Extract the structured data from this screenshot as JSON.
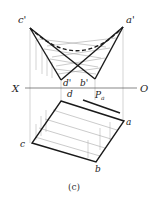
{
  "figure": {
    "caption": "(c)",
    "axis": {
      "left_label": "X",
      "right_label": "O"
    },
    "upper_view": {
      "points": {
        "c_prime": {
          "label": "c'",
          "x": 30,
          "y": 28
        },
        "a_prime": {
          "label": "a'",
          "x": 123,
          "y": 27
        },
        "d_prime": {
          "label": "d'",
          "x": 61,
          "y": 80
        },
        "b_prime": {
          "label": "b'",
          "x": 95,
          "y": 79
        }
      }
    },
    "lower_view": {
      "points": {
        "d": {
          "label": "d",
          "x": 61,
          "y": 101
        },
        "a": {
          "label": "a",
          "x": 124,
          "y": 121
        },
        "b": {
          "label": "b",
          "x": 96,
          "y": 162
        },
        "c": {
          "label": "c",
          "x": 32,
          "y": 143
        }
      },
      "trace_label": "P",
      "trace_subscript": "a"
    },
    "colors": {
      "line": "#1a1a1a",
      "thin": "#9a9a9a",
      "background": "#ffffff"
    }
  }
}
